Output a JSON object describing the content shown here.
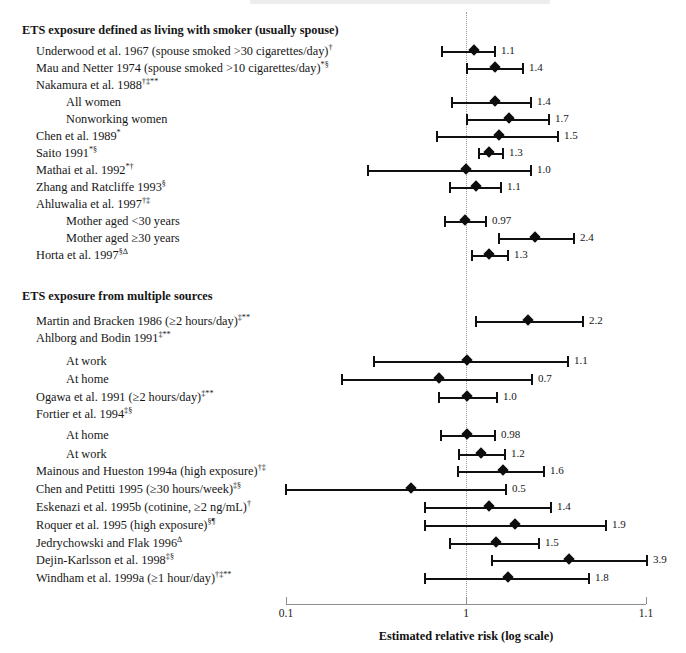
{
  "figure": {
    "axis_title": "Estimated relative risk (log scale)",
    "tick_labels": [
      "0.1",
      "1",
      "1.1"
    ],
    "null_value": "1"
  },
  "groups": [
    {
      "label": "ETS exposure defined as living with smoker (usually spouse)"
    },
    {
      "label": "ETS exposure from multiple sources"
    }
  ],
  "rows": [
    {
      "label": "ETS exposure defined as living with smoker (usually spouse)",
      "sup": "",
      "kind": "group",
      "value": "",
      "y": 22
    },
    {
      "label": "Underwood et al. 1967 (spouse smoked >30 cigarettes/day)",
      "sup": "†",
      "kind": "study",
      "value": "1.1",
      "y": 43
    },
    {
      "label": "Mau and Netter 1974 (spouse smoked >10 cigarettes/day)",
      "sup": "*§",
      "kind": "study",
      "value": "1.4",
      "y": 60
    },
    {
      "label": "Nakamura et al. 1988",
      "sup": "†‡**",
      "kind": "study",
      "value": "",
      "y": 77
    },
    {
      "label": "All women",
      "sup": "",
      "kind": "sub",
      "value": "1.4",
      "y": 94
    },
    {
      "label": "Nonworking women",
      "sup": "",
      "kind": "sub",
      "value": "1.7",
      "y": 111
    },
    {
      "label": "Chen et al. 1989",
      "sup": "*",
      "kind": "study",
      "value": "1.5",
      "y": 128
    },
    {
      "label": "Saito 1991",
      "sup": "*§",
      "kind": "study",
      "value": "1.3",
      "y": 145
    },
    {
      "label": "Mathai et al. 1992",
      "sup": "*†",
      "kind": "study",
      "value": "1.0",
      "y": 162
    },
    {
      "label": "Zhang and Ratcliffe 1993",
      "sup": "§",
      "kind": "study",
      "value": "1.1",
      "y": 179
    },
    {
      "label": "Ahluwalia et al. 1997",
      "sup": "†‡",
      "kind": "study",
      "value": "",
      "y": 196
    },
    {
      "label": "Mother aged <30 years",
      "sup": "",
      "kind": "sub",
      "value": "0.97",
      "y": 213
    },
    {
      "label": "Mother aged ≥30 years",
      "sup": "",
      "kind": "sub",
      "value": "2.4",
      "y": 230
    },
    {
      "label": "Horta et al. 1997",
      "sup": "§∆",
      "kind": "study",
      "value": "1.3",
      "y": 247
    },
    {
      "label": "ETS exposure from multiple sources",
      "sup": "",
      "kind": "group",
      "value": "",
      "y": 288
    },
    {
      "label": "Martin and Bracken 1986 (≥2 hours/day)",
      "sup": "‡**",
      "kind": "study",
      "value": "2.2",
      "y": 313
    },
    {
      "label": "Ahlborg and Bodin 1991",
      "sup": "‡**",
      "kind": "study",
      "value": "",
      "y": 330
    },
    {
      "label": "At work",
      "sup": "",
      "kind": "sub",
      "value": "1.1",
      "y": 353
    },
    {
      "label": "At home",
      "sup": "",
      "kind": "sub",
      "value": "0.7",
      "y": 371
    },
    {
      "label": "Ogawa et al. 1991 (≥2 hours/day)",
      "sup": "‡**",
      "kind": "study",
      "value": "1.0",
      "y": 389
    },
    {
      "label": "Fortier et al. 1994",
      "sup": "‡§",
      "kind": "study",
      "value": "",
      "y": 406
    },
    {
      "label": "At home",
      "sup": "",
      "kind": "sub",
      "value": "0.98",
      "y": 427
    },
    {
      "label": "At work",
      "sup": "",
      "kind": "sub",
      "value": "1.2",
      "y": 446
    },
    {
      "label": "Mainous and Hueston 1994a (high exposure)",
      "sup": "†‡",
      "kind": "study",
      "value": "1.6",
      "y": 463
    },
    {
      "label": "Chen and Petitti 1995 (≥30 hours/week)",
      "sup": "‡§",
      "kind": "study",
      "value": "0.5",
      "y": 481
    },
    {
      "label": "Eskenazi et al. 1995b (cotinine, ≥2 ng/mL)",
      "sup": "†",
      "kind": "study",
      "value": "1.4",
      "y": 499
    },
    {
      "label": "Roquer et al. 1995 (high exposure)",
      "sup": "§¶",
      "kind": "study",
      "value": "1.9",
      "y": 517
    },
    {
      "label": "Jedrychowski and Flak 1996",
      "sup": "∆",
      "kind": "study",
      "value": "1.5",
      "y": 535
    },
    {
      "label": "Dejin-Karlsson et al. 1998",
      "sup": "‡§",
      "kind": "study",
      "value": "3.9",
      "y": 552
    },
    {
      "label": "Windham et al. 1999a (≥1 hour/day)",
      "sup": "†‡**",
      "kind": "study",
      "value": "1.8",
      "y": 570
    }
  ],
  "chart_data": {
    "type": "forest",
    "title": "",
    "xlabel": "Estimated relative risk (log scale)",
    "ylabel": "",
    "scale": "log",
    "xlim": [
      0.1,
      1.1
    ],
    "xticks": [
      0.1,
      1,
      1.1
    ],
    "xticklabels": [
      "0.1",
      "1",
      "1.1"
    ],
    "null_reference": 1,
    "grid": false,
    "legend": "none",
    "note": "Point estimates and 95% confidence intervals are drawn on a log axis; pixel geometry is stored per-row in px_left/px_point/px_right relative to the plot frame (0.1 at x=286px, 1 at x=466px, 1.1 at x=646px).",
    "points": [
      {
        "study": "Underwood et al. 1967 (spouse smoked >30 cigarettes/day)",
        "group": "ETS exposure defined as living with smoker (usually spouse)",
        "estimate": 1.1,
        "label": "1.1",
        "px_left": 442,
        "px_point": 474,
        "px_right": 495
      },
      {
        "study": "Mau and Netter 1974 (spouse smoked >10 cigarettes/day)",
        "group": "ETS exposure defined as living with smoker (usually spouse)",
        "estimate": 1.4,
        "label": "1.4",
        "px_left": 467,
        "px_point": 495,
        "px_right": 523
      },
      {
        "study": "Nakamura et al. 1988 — All women",
        "group": "ETS exposure defined as living with smoker (usually spouse)",
        "estimate": 1.4,
        "label": "1.4",
        "px_left": 452,
        "px_point": 495,
        "px_right": 531
      },
      {
        "study": "Nakamura et al. 1988 — Nonworking women",
        "group": "ETS exposure defined as living with smoker (usually spouse)",
        "estimate": 1.7,
        "label": "1.7",
        "px_left": 467,
        "px_point": 509,
        "px_right": 549
      },
      {
        "study": "Chen et al. 1989",
        "group": "ETS exposure defined as living with smoker (usually spouse)",
        "estimate": 1.5,
        "label": "1.5",
        "px_left": 437,
        "px_point": 499,
        "px_right": 558
      },
      {
        "study": "Saito 1991",
        "group": "ETS exposure defined as living with smoker (usually spouse)",
        "estimate": 1.3,
        "label": "1.3",
        "px_left": 479,
        "px_point": 489,
        "px_right": 503
      },
      {
        "study": "Mathai et al. 1992",
        "group": "ETS exposure defined as living with smoker (usually spouse)",
        "estimate": 1.0,
        "label": "1.0",
        "px_left": 368,
        "px_point": 466,
        "px_right": 531
      },
      {
        "study": "Zhang and Ratcliffe 1993",
        "group": "ETS exposure defined as living with smoker (usually spouse)",
        "estimate": 1.1,
        "label": "1.1",
        "px_left": 450,
        "px_point": 476,
        "px_right": 501
      },
      {
        "study": "Ahluwalia et al. 1997 — Mother aged <30 years",
        "group": "ETS exposure defined as living with smoker (usually spouse)",
        "estimate": 0.97,
        "label": "0.97",
        "px_left": 445,
        "px_point": 465,
        "px_right": 486
      },
      {
        "study": "Ahluwalia et al. 1997 — Mother aged ≥30 years",
        "group": "ETS exposure defined as living with smoker (usually spouse)",
        "estimate": 2.4,
        "label": "2.4",
        "px_left": 499,
        "px_point": 535,
        "px_right": 574
      },
      {
        "study": "Horta et al. 1997",
        "group": "ETS exposure defined as living with smoker (usually spouse)",
        "estimate": 1.3,
        "label": "1.3",
        "px_left": 472,
        "px_point": 489,
        "px_right": 508
      },
      {
        "study": "Martin and Bracken 1986 (≥2 hours/day)",
        "group": "ETS exposure from multiple sources",
        "estimate": 2.2,
        "label": "2.2",
        "px_left": 476,
        "px_point": 528,
        "px_right": 583
      },
      {
        "study": "Ahlborg and Bodin 1991 — At work",
        "group": "ETS exposure from multiple sources",
        "estimate": 1.1,
        "label": "1.1",
        "px_left": 374,
        "px_point": 467,
        "px_right": 568
      },
      {
        "study": "Ahlborg and Bodin 1991 — At home",
        "group": "ETS exposure from multiple sources",
        "estimate": 0.7,
        "label": "0.7",
        "px_left": 342,
        "px_point": 439,
        "px_right": 532
      },
      {
        "study": "Ogawa et al. 1991 (≥2 hours/day)",
        "group": "ETS exposure from multiple sources",
        "estimate": 1.0,
        "label": "1.0",
        "px_left": 439,
        "px_point": 467,
        "px_right": 497
      },
      {
        "study": "Fortier et al. 1994 — At home",
        "group": "ETS exposure from multiple sources",
        "estimate": 0.98,
        "label": "0.98",
        "px_left": 441,
        "px_point": 467,
        "px_right": 495
      },
      {
        "study": "Fortier et al. 1994 — At work",
        "group": "ETS exposure from multiple sources",
        "estimate": 1.2,
        "label": "1.2",
        "px_left": 459,
        "px_point": 481,
        "px_right": 505
      },
      {
        "study": "Mainous and Hueston 1994a (high exposure)",
        "group": "ETS exposure from multiple sources",
        "estimate": 1.6,
        "label": "1.6",
        "px_left": 458,
        "px_point": 503,
        "px_right": 544
      },
      {
        "study": "Chen and Petitti 1995 (≥30 hours/week)",
        "group": "ETS exposure from multiple sources",
        "estimate": 0.5,
        "label": "0.5",
        "px_left": 286,
        "px_point": 411,
        "px_right": 506
      },
      {
        "study": "Eskenazi et al. 1995b (cotinine, ≥2 ng/mL)",
        "group": "ETS exposure from multiple sources",
        "estimate": 1.4,
        "label": "1.4",
        "px_left": 425,
        "px_point": 489,
        "px_right": 551
      },
      {
        "study": "Roquer et al. 1995 (high exposure)",
        "group": "ETS exposure from multiple sources",
        "estimate": 1.9,
        "label": "1.9",
        "px_left": 425,
        "px_point": 515,
        "px_right": 606
      },
      {
        "study": "Jedrychowski and Flak 1996",
        "group": "ETS exposure from multiple sources",
        "estimate": 1.5,
        "label": "1.5",
        "px_left": 450,
        "px_point": 496,
        "px_right": 539
      },
      {
        "study": "Dejin-Karlsson et al. 1998",
        "group": "ETS exposure from multiple sources",
        "estimate": 3.9,
        "label": "3.9",
        "px_left": 492,
        "px_point": 569,
        "px_right": 647
      },
      {
        "study": "Windham et al. 1999a (≥1 hour/day)",
        "group": "ETS exposure from multiple sources",
        "estimate": 1.8,
        "label": "1.8",
        "px_left": 425,
        "px_point": 508,
        "px_right": 589
      }
    ]
  }
}
